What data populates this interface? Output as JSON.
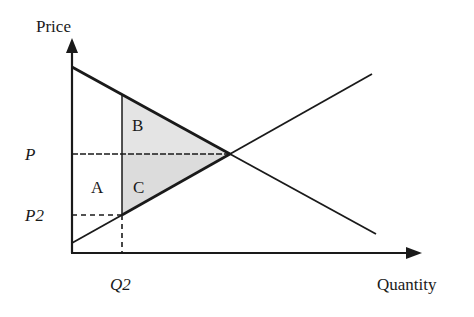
{
  "axes": {
    "y_label": "Price",
    "x_label": "Quantity"
  },
  "ticks": {
    "p": "P",
    "p2": "P2",
    "q2": "Q2"
  },
  "regions": {
    "a": "A",
    "b": "B",
    "c": "C"
  },
  "colors": {
    "line": "#1a1a1a",
    "shade": "#e4e4e4"
  },
  "geometry": {
    "origin": [
      72,
      253
    ],
    "demand": {
      "start": [
        72,
        67
      ],
      "end": [
        376,
        234
      ]
    },
    "supply": {
      "start": [
        72,
        243
      ],
      "end": [
        372,
        74
      ]
    },
    "equilibrium": [
      230,
      154
    ],
    "q2_x": 122,
    "p2_y": 215
  }
}
